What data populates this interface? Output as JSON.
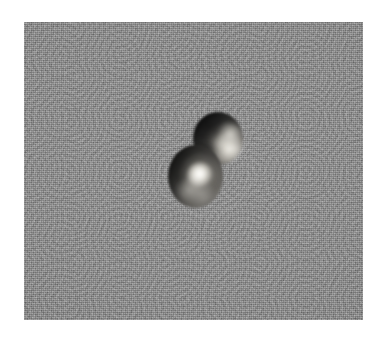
{
  "figure": {
    "kind": "grayscale-micrograph",
    "caption": "",
    "page_background": "#ffffff",
    "field": {
      "background_color": "#8b8b8b",
      "left": 24,
      "top": 22,
      "width": 339,
      "height": 298,
      "texture": "film-grain",
      "has_scale_bar": false,
      "has_annotation_text": false,
      "has_axis_labels": false
    },
    "subject": {
      "name": "doublet-particle",
      "description": "two overlapping dark spheroids",
      "lobe_count": 2,
      "lobes": [
        {
          "id": "lobe-upper",
          "position_label": "upper-right",
          "center_x": 218,
          "center_y": 138,
          "width": 50,
          "height": 53,
          "shading": "dark upper-left limb, bright mottled granules lower-right",
          "dark_tone": "#1a1a1a",
          "light_tone": "#e8e5da"
        },
        {
          "id": "lobe-lower",
          "position_label": "lower-left",
          "center_x": 195,
          "center_y": 176,
          "width": 55,
          "height": 63,
          "shading": "dark left limb, single bright central highlight",
          "dark_tone": "#232322",
          "light_tone": "#f6f4ec"
        }
      ]
    }
  }
}
